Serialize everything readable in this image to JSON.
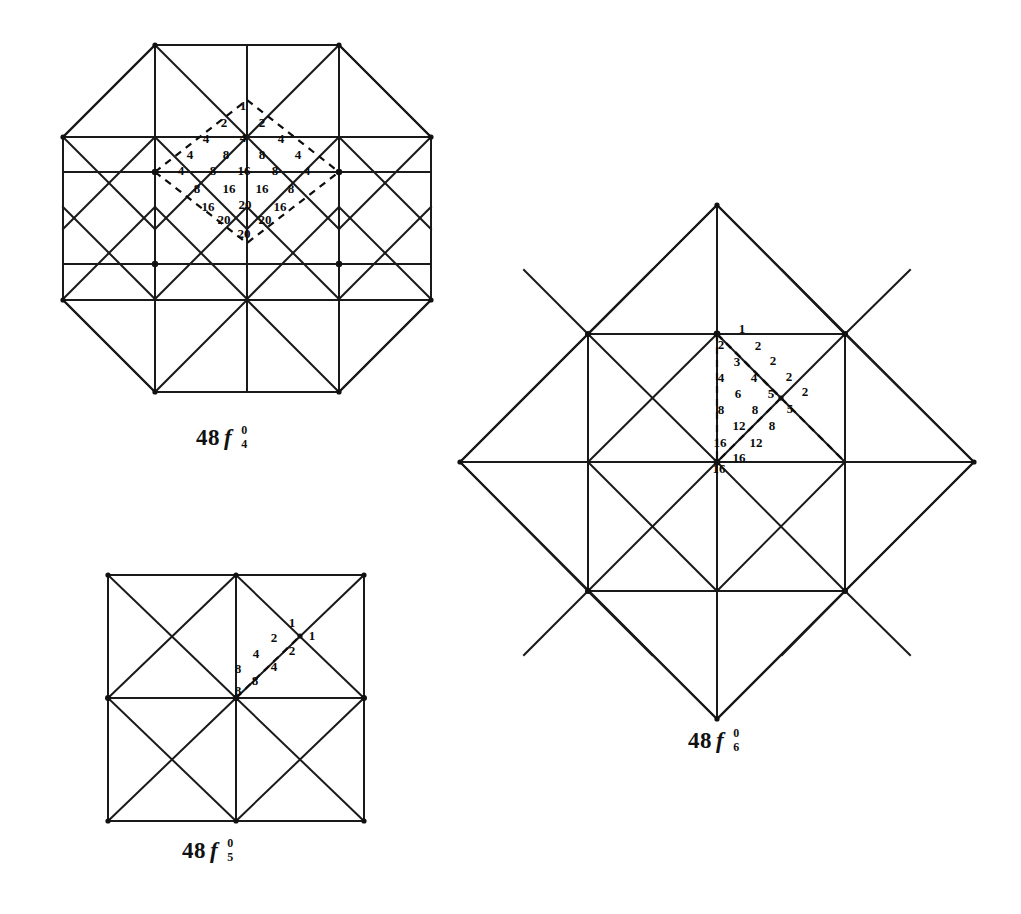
{
  "page": {
    "background_color": "#ffffff",
    "line_color": "#1a1a1a",
    "text_color": "#0b0b0b"
  },
  "figures": [
    {
      "id": "fig-48f4",
      "shape": "octagon",
      "caption": {
        "coefficient": "48",
        "symbol": "f",
        "superscript": "0",
        "subscript": "4"
      },
      "caption_text": "48 f 0 4",
      "labels": [
        {
          "value": "1",
          "x": 243,
          "y": 107
        },
        {
          "value": "2",
          "x": 224,
          "y": 124
        },
        {
          "value": "2",
          "x": 262,
          "y": 124
        },
        {
          "value": "4",
          "x": 206,
          "y": 140
        },
        {
          "value": "4",
          "x": 243,
          "y": 139
        },
        {
          "value": "4",
          "x": 281,
          "y": 140
        },
        {
          "value": "4",
          "x": 190,
          "y": 156
        },
        {
          "value": "8",
          "x": 226,
          "y": 156
        },
        {
          "value": "8",
          "x": 262,
          "y": 156
        },
        {
          "value": "4",
          "x": 298,
          "y": 156
        },
        {
          "value": "4",
          "x": 181,
          "y": 172
        },
        {
          "value": "8",
          "x": 213,
          "y": 172
        },
        {
          "value": "16",
          "x": 244,
          "y": 172
        },
        {
          "value": "8",
          "x": 275,
          "y": 172
        },
        {
          "value": "4",
          "x": 307,
          "y": 172
        },
        {
          "value": "8",
          "x": 197,
          "y": 190
        },
        {
          "value": "16",
          "x": 229,
          "y": 190
        },
        {
          "value": "16",
          "x": 262,
          "y": 190
        },
        {
          "value": "8",
          "x": 291,
          "y": 190
        },
        {
          "value": "16",
          "x": 208,
          "y": 208
        },
        {
          "value": "20",
          "x": 245,
          "y": 206
        },
        {
          "value": "16",
          "x": 280,
          "y": 208
        },
        {
          "value": "20",
          "x": 224,
          "y": 221
        },
        {
          "value": "20",
          "x": 265,
          "y": 221
        },
        {
          "value": "20",
          "x": 244,
          "y": 235
        }
      ]
    },
    {
      "id": "fig-48f5",
      "shape": "square",
      "caption": {
        "coefficient": "48",
        "symbol": "f",
        "superscript": "0",
        "subscript": "5"
      },
      "caption_text": "48 f 0 5",
      "labels": [
        {
          "value": "1",
          "x": 292,
          "y": 624
        },
        {
          "value": "1",
          "x": 312,
          "y": 637
        },
        {
          "value": "2",
          "x": 274,
          "y": 639
        },
        {
          "value": "2",
          "x": 292,
          "y": 652
        },
        {
          "value": "4",
          "x": 256,
          "y": 655
        },
        {
          "value": "4",
          "x": 274,
          "y": 668
        },
        {
          "value": "8",
          "x": 238,
          "y": 670
        },
        {
          "value": "8",
          "x": 255,
          "y": 682
        },
        {
          "value": "8",
          "x": 238,
          "y": 692
        }
      ]
    },
    {
      "id": "fig-48f6",
      "shape": "diamond",
      "caption": {
        "coefficient": "48",
        "symbol": "f",
        "superscript": "0",
        "subscript": "6"
      },
      "caption_text": "48 f 0 6",
      "labels": [
        {
          "value": "1",
          "x": 742,
          "y": 330
        },
        {
          "value": "2",
          "x": 721,
          "y": 346
        },
        {
          "value": "2",
          "x": 758,
          "y": 347
        },
        {
          "value": "3",
          "x": 737,
          "y": 363
        },
        {
          "value": "2",
          "x": 773,
          "y": 362
        },
        {
          "value": "4",
          "x": 721,
          "y": 379
        },
        {
          "value": "4",
          "x": 754,
          "y": 379
        },
        {
          "value": "2",
          "x": 789,
          "y": 378
        },
        {
          "value": "6",
          "x": 738,
          "y": 395
        },
        {
          "value": "5",
          "x": 771,
          "y": 395
        },
        {
          "value": "2",
          "x": 805,
          "y": 393
        },
        {
          "value": "8",
          "x": 721,
          "y": 411
        },
        {
          "value": "8",
          "x": 755,
          "y": 411
        },
        {
          "value": "5",
          "x": 790,
          "y": 410
        },
        {
          "value": "12",
          "x": 739,
          "y": 427
        },
        {
          "value": "8",
          "x": 772,
          "y": 427
        },
        {
          "value": "16",
          "x": 720,
          "y": 444
        },
        {
          "value": "12",
          "x": 756,
          "y": 444
        },
        {
          "value": "16",
          "x": 739,
          "y": 459
        },
        {
          "value": "16",
          "x": 719,
          "y": 470
        }
      ]
    }
  ]
}
